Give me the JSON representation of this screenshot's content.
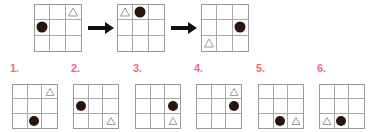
{
  "puzzle": {
    "type": "visual-sequence-reasoning",
    "grid_size": 3,
    "shape_names": {
      "circle": "filled-circle",
      "triangle": "outline-triangle"
    },
    "colors": {
      "background": "#ffffff",
      "grid_line": "#a8a8a8",
      "grid_border": "#9a9a9a",
      "circle_fill": "#2a1410",
      "triangle_stroke": "#9b9b9b",
      "arrow": "#111111",
      "option_number": "#f26b7a"
    },
    "arrow_symbol": "right-arrow",
    "sequence": [
      {
        "index": 1,
        "cells": [
          "",
          "",
          "triangle",
          "circle",
          "",
          "",
          "",
          "",
          ""
        ],
        "description": "triangle top-right, circle middle-left"
      },
      {
        "index": 2,
        "cells": [
          "triangle",
          "circle",
          "",
          "",
          "",
          "",
          "",
          "",
          ""
        ],
        "description": "triangle top-left, circle top-middle"
      },
      {
        "index": 3,
        "cells": [
          "",
          "",
          "",
          "",
          "",
          "circle",
          "triangle",
          "",
          ""
        ],
        "description": "circle middle-right, triangle bottom-left"
      }
    ],
    "options": [
      {
        "label": "1.",
        "number": 1,
        "cells": [
          "",
          "",
          "triangle",
          "",
          "",
          "",
          "",
          "circle",
          ""
        ],
        "description": "triangle top-right, circle bottom-middle"
      },
      {
        "label": "2.",
        "number": 2,
        "cells": [
          "",
          "",
          "",
          "circle",
          "",
          "",
          "",
          "",
          "triangle"
        ],
        "description": "circle middle-left, triangle bottom-right"
      },
      {
        "label": "3.",
        "number": 3,
        "cells": [
          "",
          "",
          "",
          "",
          "",
          "circle",
          "",
          "",
          "triangle"
        ],
        "description": "circle middle-right, triangle bottom-right"
      },
      {
        "label": "4.",
        "number": 4,
        "cells": [
          "",
          "",
          "triangle",
          "",
          "",
          "circle",
          "",
          "",
          ""
        ],
        "description": "triangle top-right, circle middle-right"
      },
      {
        "label": "5.",
        "number": 5,
        "cells": [
          "",
          "",
          "",
          "",
          "",
          "",
          "",
          "circle",
          "triangle"
        ],
        "description": "circle bottom-middle, triangle bottom-right"
      },
      {
        "label": "6.",
        "number": 6,
        "cells": [
          "",
          "",
          "",
          "",
          "",
          "",
          "triangle",
          "circle",
          ""
        ],
        "description": "triangle bottom-left, circle bottom-middle"
      }
    ]
  }
}
